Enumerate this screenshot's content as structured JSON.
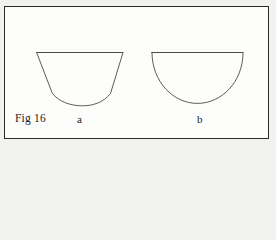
{
  "plate": {
    "name": "figure-plate",
    "background_color": "#fdfdfb",
    "page_background_color": "#f2f2f0",
    "border_color": "#2a2a2a",
    "ink_color": "#4a4a4a",
    "text_color": "#1c1c1c"
  },
  "caption": {
    "figure_label": "Fig 16"
  },
  "shapes": [
    {
      "key": "a",
      "label": "a",
      "description": "bowl outline with straight slanted sides and rounded bottom",
      "top_left": [
        37,
        52
      ],
      "top_right": [
        123,
        52
      ],
      "bottom_left": [
        52,
        95
      ],
      "bottom_right": [
        110,
        95
      ],
      "bottom_apex": [
        81,
        105
      ]
    },
    {
      "key": "b",
      "label": "b",
      "description": "semicircle outline with flat top edge",
      "top_left": [
        152,
        52
      ],
      "top_right": [
        243,
        52
      ],
      "bottom_apex": [
        197,
        103
      ]
    }
  ]
}
